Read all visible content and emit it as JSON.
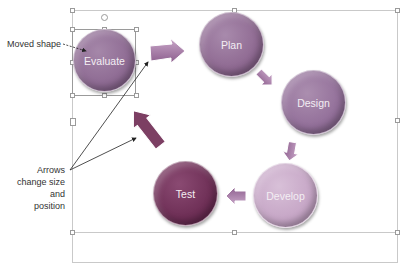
{
  "diagram": {
    "type": "cycle",
    "nodes": [
      {
        "label": "Evaluate",
        "color": "#8e6b93",
        "selected": true
      },
      {
        "label": "Plan",
        "color": "#8f6a92"
      },
      {
        "label": "Design",
        "color": "#93709a"
      },
      {
        "label": "Develop",
        "color": "#c6a6c6"
      },
      {
        "label": "Test",
        "color": "#6e2f56"
      }
    ],
    "arrow_color": "#a37aa4"
  },
  "annotations": {
    "moved_shape": "Moved shape",
    "arrows_line1": "Arrows",
    "arrows_line2": "change size",
    "arrows_line3": "and",
    "arrows_line4": "position"
  }
}
